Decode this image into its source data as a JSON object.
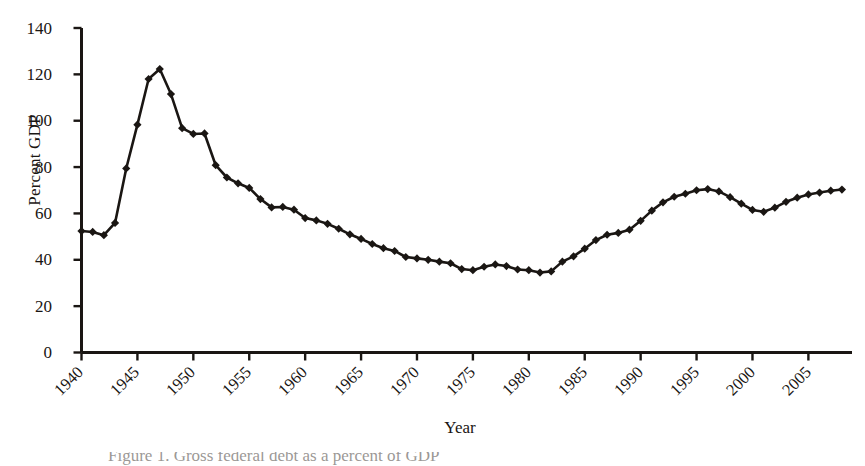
{
  "figure": {
    "background_color": "#ffffff",
    "ink_color": "#1a1613",
    "caption_partial": "Figure 1. Gross federal debt as a percent of GDP"
  },
  "axes": {
    "y": {
      "label": "Percent GDP",
      "ticks": [
        "0",
        "20",
        "40",
        "60",
        "80",
        "100",
        "120",
        "140"
      ],
      "min": 0,
      "max": 140
    },
    "x": {
      "label": "Year",
      "ticks": [
        "1940",
        "1945",
        "1950",
        "1955",
        "1960",
        "1965",
        "1970",
        "1975",
        "1980",
        "1985",
        "1990",
        "1995",
        "2000",
        "2005"
      ],
      "min": 1940,
      "max": 2008
    }
  },
  "chart_data": {
    "type": "line",
    "title": "",
    "subtitle": "",
    "xlabel": "Year",
    "ylabel": "Percent GDP",
    "xlim": [
      1940,
      2008
    ],
    "ylim": [
      0,
      140
    ],
    "grid": false,
    "legend": null,
    "marker": "diamond",
    "marker_color": "#1a1613",
    "line_color": "#1a1613",
    "x": [
      1940,
      1941,
      1942,
      1943,
      1944,
      1945,
      1946,
      1947,
      1948,
      1949,
      1950,
      1951,
      1952,
      1953,
      1954,
      1955,
      1956,
      1957,
      1958,
      1959,
      1960,
      1961,
      1962,
      1963,
      1964,
      1965,
      1966,
      1967,
      1968,
      1969,
      1970,
      1971,
      1972,
      1973,
      1974,
      1975,
      1976,
      1977,
      1978,
      1979,
      1980,
      1981,
      1982,
      1983,
      1984,
      1985,
      1986,
      1987,
      1988,
      1989,
      1990,
      1991,
      1992,
      1993,
      1994,
      1995,
      1996,
      1997,
      1998,
      1999,
      2000,
      2001,
      2002,
      2003,
      2004,
      2005,
      2006,
      2007,
      2008
    ],
    "values": [
      52.4,
      52.0,
      50.6,
      55.9,
      79.4,
      98.3,
      118.0,
      122.3,
      111.5,
      96.8,
      94.3,
      94.5,
      80.8,
      75.5,
      73.0,
      71.0,
      66.2,
      62.6,
      62.8,
      61.6,
      58.0,
      57.0,
      55.5,
      53.4,
      51.0,
      49.0,
      46.8,
      45.0,
      43.8,
      41.2,
      40.6,
      40.0,
      39.2,
      38.5,
      36.0,
      35.5,
      37.0,
      38.0,
      37.3,
      35.8,
      35.5,
      34.5,
      35.0,
      39.2,
      41.5,
      44.8,
      48.5,
      50.8,
      51.6,
      53.0,
      56.8,
      61.2,
      64.8,
      67.2,
      68.5,
      70.0,
      70.5,
      69.5,
      67.0,
      64.2,
      61.5,
      60.7,
      62.5,
      65.0,
      66.8,
      68.2,
      69.0,
      69.8,
      70.3
    ]
  }
}
